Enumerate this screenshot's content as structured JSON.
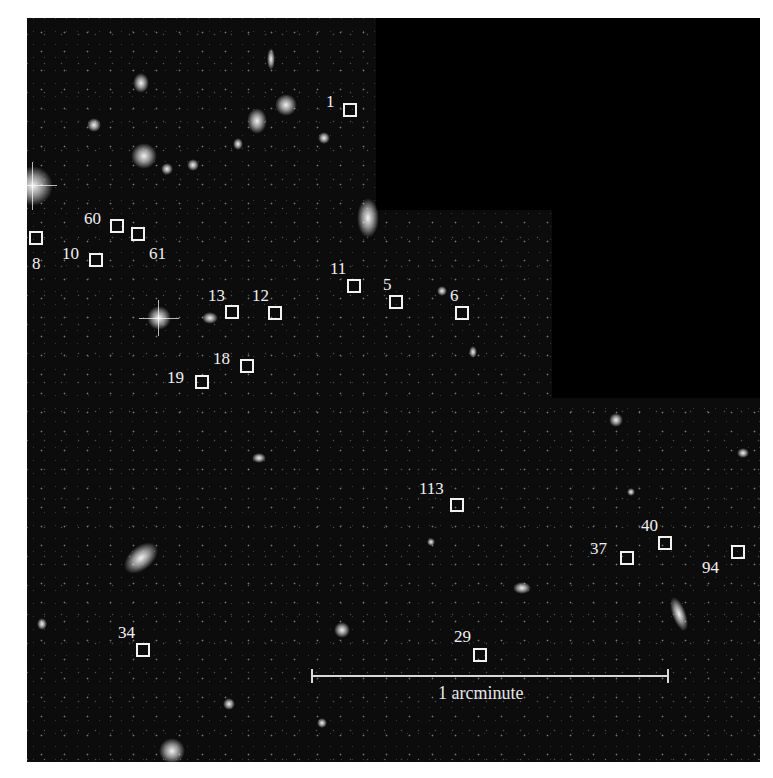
{
  "image": {
    "description": "Deep-field galaxy image with numbered square markers",
    "background_color": "#0c0c0c",
    "marker_color": "#f2f2f2"
  },
  "markers": [
    {
      "id": "1",
      "label": "1",
      "box": [
        343,
        103
      ],
      "label_pos": [
        329,
        92
      ]
    },
    {
      "id": "60",
      "label": "60",
      "box": [
        111,
        219
      ],
      "label_pos": [
        84,
        210
      ]
    },
    {
      "id": "61",
      "label": "61",
      "box": [
        132,
        228
      ],
      "label_pos": [
        148,
        245
      ]
    },
    {
      "id": "8",
      "label": "8",
      "box": [
        30,
        232
      ],
      "label_pos": [
        31,
        256
      ]
    },
    {
      "id": "10",
      "label": "10",
      "box": [
        89,
        253
      ],
      "label_pos": [
        62,
        245
      ]
    },
    {
      "id": "11",
      "label": "11",
      "box": [
        347,
        280
      ],
      "label_pos": [
        330,
        260
      ]
    },
    {
      "id": "5",
      "label": "5",
      "box": [
        389,
        295
      ],
      "label_pos": [
        383,
        276
      ]
    },
    {
      "id": "6",
      "label": "6",
      "box": [
        455,
        306
      ],
      "label_pos": [
        450,
        287
      ]
    },
    {
      "id": "13",
      "label": "13",
      "box": [
        225,
        306
      ],
      "label_pos": [
        208,
        287
      ]
    },
    {
      "id": "12",
      "label": "12",
      "box": [
        268,
        306
      ],
      "label_pos": [
        252,
        287
      ]
    },
    {
      "id": "18",
      "label": "18",
      "box": [
        240,
        360
      ],
      "label_pos": [
        213,
        350
      ]
    },
    {
      "id": "19",
      "label": "19",
      "box": [
        195,
        375
      ],
      "label_pos": [
        167,
        370
      ]
    },
    {
      "id": "113",
      "label": "113",
      "box": [
        450,
        498
      ],
      "label_pos": [
        419,
        480
      ]
    },
    {
      "id": "40",
      "label": "40",
      "box": [
        658,
        537
      ],
      "label_pos": [
        640,
        517
      ]
    },
    {
      "id": "37",
      "label": "37",
      "box": [
        620,
        552
      ],
      "label_pos": [
        590,
        540
      ]
    },
    {
      "id": "94",
      "label": "94",
      "box": [
        731,
        545
      ],
      "label_pos": [
        702,
        559
      ]
    },
    {
      "id": "34",
      "label": "34",
      "box": [
        136,
        644
      ],
      "label_pos": [
        118,
        624
      ]
    },
    {
      "id": "29",
      "label": "29",
      "box": [
        473,
        648
      ],
      "label_pos": [
        454,
        628
      ]
    }
  ],
  "scale_bar": {
    "label": "1 arcminute",
    "length_px": 358
  }
}
